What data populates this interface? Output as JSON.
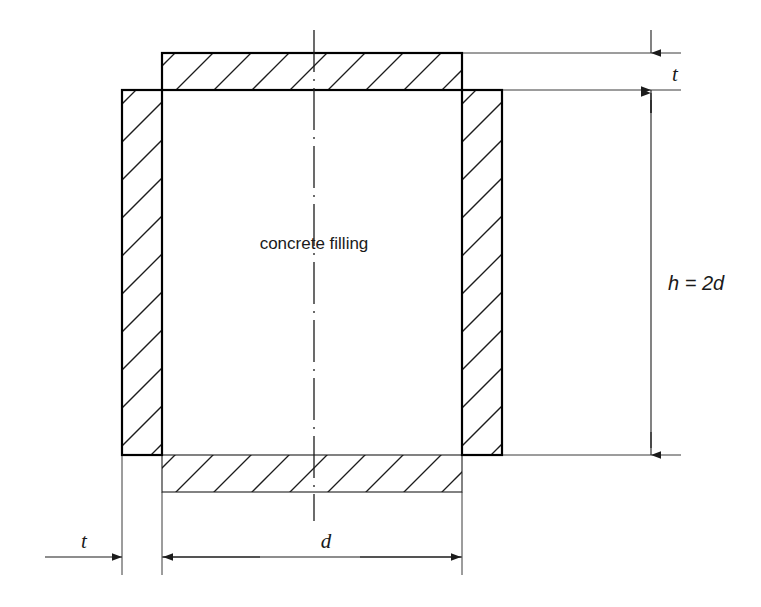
{
  "figure": {
    "type": "engineering-cross-section",
    "background_color": "#ffffff",
    "line_color": "#1c1c1c"
  },
  "labels": {
    "fill_label": "concrete filling",
    "thickness_top": "t",
    "thickness_bottom": "t",
    "width": "d",
    "height": "h = 2d"
  },
  "geometry": {
    "outer_left_x": 122,
    "inner_left_x": 162,
    "inner_right_x": 462,
    "outer_right_x": 502,
    "top_plate_top_y": 53,
    "top_plate_bottom_y": 90,
    "wall_top_y": 90,
    "wall_bottom_y": 455,
    "bottom_plate_top_y": 455,
    "bottom_plate_bottom_y": 492,
    "centerline_x": 314,
    "wall_thickness": 40,
    "plate_thickness": 37,
    "inner_width": 300,
    "inner_height": 365
  },
  "dimensions": [
    {
      "name": "top-thickness",
      "label": "t",
      "orientation": "vertical",
      "from": 53,
      "to": 90,
      "line_x": 651,
      "label_x": 672,
      "label_y": 79
    },
    {
      "name": "overall-height",
      "label": "h = 2d",
      "orientation": "vertical",
      "from": 90,
      "to": 455,
      "line_x": 651,
      "label_x": 668,
      "label_y": 283
    },
    {
      "name": "wall-thickness",
      "label": "t",
      "orientation": "horizontal",
      "from": 45,
      "to": 122,
      "line_y": 557,
      "label_x": 84,
      "label_y": 546
    },
    {
      "name": "inner-width",
      "label": "d",
      "orientation": "horizontal",
      "from": 162,
      "to": 462,
      "line_y": 557,
      "label_x": 326,
      "label_y": 546
    }
  ],
  "annotations": {
    "fill_label_x": 314,
    "fill_label_y": 249,
    "centerline_top_y": 30,
    "centerline_bottom_y": 521
  }
}
